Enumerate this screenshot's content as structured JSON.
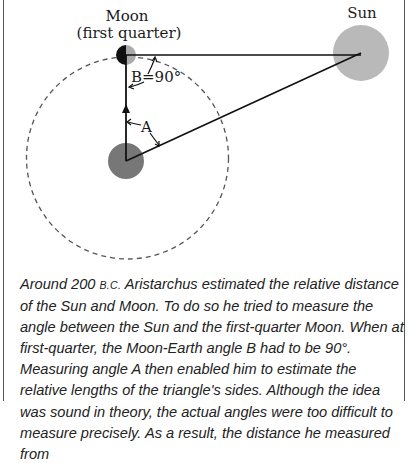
{
  "diagram": {
    "moon_label_line1": "Moon",
    "moon_label_line2": "(first quarter)",
    "sun_label": "Sun",
    "angle_b_label": "B=90°",
    "angle_a_label": "A",
    "colors": {
      "moon_dark": "#111111",
      "moon_light": "#aaaaaa",
      "earth": "#777777",
      "sun": "#b9b9b9",
      "orbit": "#555555",
      "lines": "#111111"
    }
  },
  "caption": {
    "prefix": "Around 200 ",
    "era": "B.C.",
    "text": " Aristarchus estimated the relative distance of the Sun and Moon. To do so he tried to measure the angle between the Sun and the first-quarter Moon. When at first-quarter, the Moon-Earth angle B had to be 90°. Measuring angle A then enabled him to estimate the relative lengths of the triangle's sides. Although the idea was sound in theory, the actual angles were too difficult to measure precisely. As a result, the distance he measured from"
  }
}
